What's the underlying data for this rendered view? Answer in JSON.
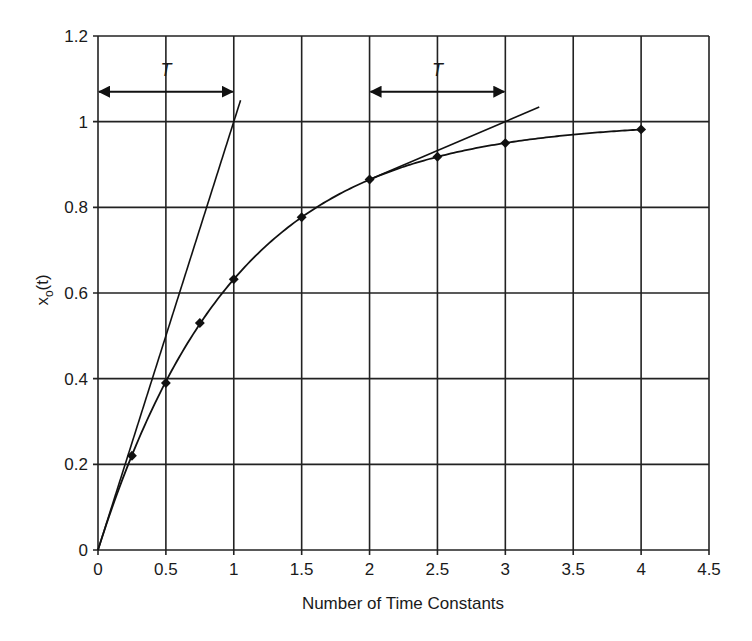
{
  "chart_data": {
    "type": "line",
    "title": "",
    "xlabel": "Number of Time Constants",
    "ylabel": "x_o(t)",
    "ylabel_main": "x",
    "ylabel_sub": "o",
    "ylabel_tail": "(t)",
    "xlim": [
      0,
      4.5
    ],
    "ylim": [
      0,
      1.2
    ],
    "grid": true,
    "legend": null,
    "x_ticks": [
      0,
      0.5,
      1,
      1.5,
      2,
      2.5,
      3,
      3.5,
      4,
      4.5
    ],
    "x_tick_labels": [
      "0",
      "0.5",
      "1",
      "1.5",
      "2",
      "2.5",
      "3",
      "3.5",
      "4",
      "4.5"
    ],
    "y_ticks": [
      0,
      0.2,
      0.4,
      0.6,
      0.8,
      1.0,
      1.2
    ],
    "y_tick_labels": [
      "0",
      "0.2",
      "0.4",
      "0.6",
      "0.8",
      "1",
      "1.2"
    ],
    "series": [
      {
        "name": "x_o(t) response",
        "x": [
          0,
          0.25,
          0.5,
          0.75,
          1,
          1.5,
          2,
          2.5,
          3,
          4
        ],
        "values": [
          0,
          0.22,
          0.39,
          0.53,
          0.632,
          0.777,
          0.865,
          0.918,
          0.95,
          0.982
        ],
        "markers": true
      },
      {
        "name": "initial tangent",
        "x": [
          0,
          1.05
        ],
        "values": [
          0,
          1.05
        ],
        "markers": false
      },
      {
        "name": "tangent at t=2",
        "x": [
          0.0,
          3.25
        ],
        "values": [
          0.0,
          1.03
        ],
        "segment_x": [
          2,
          3.25
        ],
        "segment_values": [
          0.865,
          1.034
        ],
        "markers": false
      }
    ],
    "annotations": [
      {
        "label": "T",
        "type": "double-arrow",
        "x_from": 0,
        "x_to": 1,
        "y": 1.07
      },
      {
        "label": "T",
        "type": "double-arrow",
        "x_from": 2,
        "x_to": 3,
        "y": 1.07
      }
    ]
  }
}
